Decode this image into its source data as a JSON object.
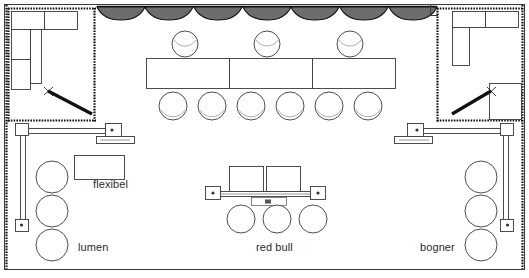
{
  "plan": {
    "title": "Messestand Grundriss",
    "canvas": {
      "width": 529,
      "height": 278
    },
    "background_color": "#ffffff",
    "line_color": "#3a3a3a",
    "hatch_color": "#111111",
    "curtain_color": "#6d6d6d",
    "labels": [
      {
        "id": "flexibel",
        "text": "flexibel",
        "x": 93,
        "y": 178
      },
      {
        "id": "lumen",
        "text": "lumen",
        "x": 78,
        "y": 248
      },
      {
        "id": "red-bull",
        "text": "red bull",
        "x": 256,
        "y": 248
      },
      {
        "id": "bogner",
        "text": "bogner",
        "x": 420,
        "y": 248
      }
    ],
    "outer_frame": {
      "x": 4,
      "y": 4,
      "width": 521,
      "height": 266
    },
    "rooms": [
      {
        "id": "room-left",
        "name": "left-corner-room",
        "x": 8,
        "y": 7,
        "width": 88,
        "height": 115,
        "counters": [
          {
            "x": 11,
            "y": 10,
            "width": 33,
            "height": 19
          },
          {
            "x": 44,
            "y": 10,
            "width": 33,
            "height": 19
          },
          {
            "x": 11,
            "y": 29,
            "width": 19,
            "height": 30
          },
          {
            "x": 11,
            "y": 59,
            "width": 19,
            "height": 30
          },
          {
            "x": 30,
            "y": 29,
            "width": 12,
            "height": 54
          }
        ],
        "door": {
          "hinge_x": 50,
          "hinge_y": 92,
          "tip_x": 93,
          "tip_y": 114
        }
      },
      {
        "id": "room-right",
        "name": "right-corner-room",
        "x": 437,
        "y": 7,
        "width": 86,
        "height": 115,
        "counters": [
          {
            "x": 452,
            "y": 10,
            "width": 33,
            "height": 17
          },
          {
            "x": 485,
            "y": 10,
            "width": 33,
            "height": 17
          },
          {
            "x": 452,
            "y": 27,
            "width": 18,
            "height": 38
          },
          {
            "x": 490,
            "y": 83,
            "width": 32,
            "height": 36
          }
        ],
        "door": {
          "hinge_x": 490,
          "hinge_y": 92,
          "tip_x": 452,
          "tip_y": 114
        }
      }
    ],
    "curtains": {
      "name": "ceiling-drape-scallops",
      "start_x": 97,
      "end_x": 437,
      "y": 6,
      "count": 7,
      "depth": 13
    },
    "main_tables": {
      "name": "banquet-table-row",
      "x": 146,
      "y": 58,
      "width": 250,
      "height": 31,
      "segments": 3
    },
    "chairs_top": {
      "name": "chairs-above-banquet-table",
      "y": 44,
      "radius": 13,
      "cx": [
        185,
        267,
        350
      ]
    },
    "chairs_bottom": {
      "name": "chairs-below-banquet-table",
      "y": 106,
      "radius": 14,
      "cx": [
        173,
        212,
        251,
        290,
        329,
        368
      ]
    },
    "desk_left": {
      "name": "flexibel-desk",
      "x": 74,
      "y": 155,
      "width": 50,
      "height": 24
    },
    "chairs_left_column": {
      "name": "lumen-chairs",
      "cx": 52,
      "radius": 16,
      "cy": [
        177,
        211,
        245
      ]
    },
    "chairs_right_column": {
      "name": "bogner-chairs",
      "cx": 481,
      "radius": 16,
      "cy": [
        177,
        211,
        245
      ]
    },
    "center_desks": {
      "name": "red-bull-desks",
      "tables": [
        {
          "x": 229,
          "y": 166,
          "width": 34,
          "height": 25
        },
        {
          "x": 266,
          "y": 166,
          "width": 34,
          "height": 25
        }
      ],
      "rail": {
        "x": 212,
        "y": 191,
        "width": 106,
        "height": 6
      },
      "end_blocks": [
        {
          "x": 206,
          "y": 186,
          "width": 15,
          "height": 13
        },
        {
          "x": 310,
          "y": 186,
          "width": 15,
          "height": 13
        }
      ],
      "small_block": {
        "x": 251,
        "y": 198,
        "width": 35,
        "height": 8
      }
    },
    "chairs_center": {
      "name": "red-bull-chairs",
      "cy": 219,
      "radius": 14,
      "cx": [
        241,
        277,
        313
      ]
    },
    "rails": [
      {
        "id": "rail-left",
        "name": "left-partition-rail",
        "vertical": {
          "x": 20,
          "y": 128,
          "width": 5,
          "height": 98
        },
        "horizontal": {
          "x": 20,
          "y": 128,
          "width": 95,
          "height": 5
        },
        "post_top": {
          "x": 16,
          "y": 124,
          "width": 13,
          "height": 12
        },
        "post_bottom": {
          "x": 16,
          "y": 219,
          "width": 13,
          "height": 12
        },
        "post_end": {
          "x": 106,
          "y": 124,
          "width": 16,
          "height": 13
        },
        "foot": {
          "x": 97,
          "y": 136,
          "width": 38,
          "height": 7
        }
      },
      {
        "id": "rail-right",
        "name": "right-partition-rail",
        "vertical": {
          "x": 504,
          "y": 128,
          "width": 5,
          "height": 98
        },
        "horizontal": {
          "x": 414,
          "y": 128,
          "width": 95,
          "height": 5
        },
        "post_top": {
          "x": 500,
          "y": 124,
          "width": 13,
          "height": 12
        },
        "post_bottom": {
          "x": 500,
          "y": 219,
          "width": 13,
          "height": 12
        },
        "post_end": {
          "x": 407,
          "y": 124,
          "width": 16,
          "height": 13
        },
        "foot": {
          "x": 394,
          "y": 136,
          "width": 38,
          "height": 7
        }
      }
    ]
  }
}
